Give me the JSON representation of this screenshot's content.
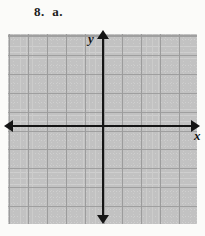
{
  "problem": {
    "label": "8.  a."
  },
  "graph": {
    "x_axis_label": "x",
    "y_axis_label": "y",
    "colors": {
      "axis": "#151515",
      "grid_minor": "#c4c4c4",
      "grid_major": "#9a9a9a",
      "background": "#fbfbf9",
      "text": "#1c1c1c"
    }
  },
  "chart_data": {
    "type": "scatter",
    "title": "",
    "subtitle": "",
    "xlabel": "x",
    "ylabel": "y",
    "series": [
      {
        "name": "",
        "x": [],
        "y": []
      }
    ],
    "x": [],
    "values": [],
    "categories": [],
    "xlim": [
      -8,
      7
    ],
    "ylim": [
      -7,
      7
    ],
    "xticks": [],
    "yticks": [],
    "grid": true,
    "grid_minor_spacing": 1,
    "grid_major_spacing": 3,
    "legend": false,
    "legend_position": "none",
    "annotations": []
  }
}
